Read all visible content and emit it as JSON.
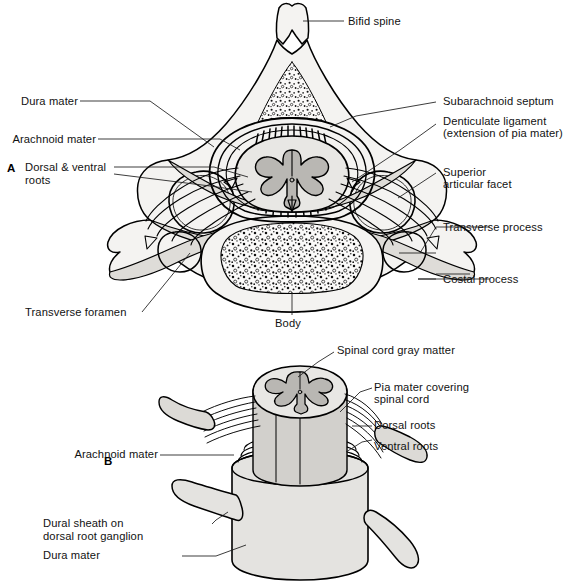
{
  "figure": {
    "type": "anatomical-line-diagram",
    "panel_count": 2,
    "background_color": "#ffffff",
    "ink_color": "#000000"
  },
  "panels": [
    {
      "id": "A",
      "letter": "A",
      "view": "Transverse section through cervical vertebra and spinal cord",
      "labels": [
        {
          "key": "bifid-spine",
          "text": "Bifid spine",
          "side": "right",
          "lines": [
            "Bifid spine"
          ]
        },
        {
          "key": "subarachnoid-septum",
          "text": "Subarachnoid septum",
          "side": "right",
          "lines": [
            "Subarachnoid septum"
          ]
        },
        {
          "key": "denticulate-ligament",
          "text": "Denticulate ligament (extension of pia mater)",
          "side": "right",
          "lines": [
            "Denticulate ligament",
            "(extension of pia mater)"
          ]
        },
        {
          "key": "superior-articular-facet",
          "text": "Superior articular facet",
          "side": "right",
          "lines": [
            "Superior",
            "articular facet"
          ]
        },
        {
          "key": "transverse-process",
          "text": "Transverse process",
          "side": "right",
          "lines": [
            "Transverse process"
          ]
        },
        {
          "key": "costal-process",
          "text": "Costal process",
          "side": "right",
          "lines": [
            "Costal process"
          ]
        },
        {
          "key": "dura-mater",
          "text": "Dura mater",
          "side": "left",
          "lines": [
            "Dura mater"
          ]
        },
        {
          "key": "arachnoid-mater",
          "text": "Arachnoid mater",
          "side": "left",
          "lines": [
            "Arachnoid mater"
          ]
        },
        {
          "key": "dorsal-ventral-roots",
          "text": "Dorsal & ventral roots",
          "side": "left",
          "lines": [
            "Dorsal & ventral",
            "roots"
          ]
        },
        {
          "key": "transverse-foramen",
          "text": "Transverse foramen",
          "side": "left",
          "lines": [
            "Transverse foramen"
          ]
        },
        {
          "key": "body",
          "text": "Body",
          "side": "bottom",
          "lines": [
            "Body"
          ]
        }
      ]
    },
    {
      "id": "B",
      "letter": "B",
      "view": "Three-dimensional view of spinal cord within dural sheath",
      "labels": [
        {
          "key": "spinal-cord-gray-matter",
          "text": "Spinal cord gray matter",
          "side": "right",
          "lines": [
            "Spinal cord gray matter"
          ]
        },
        {
          "key": "pia-mater-covering-spinal-cord",
          "text": "Pia mater covering spinal cord",
          "side": "right",
          "lines": [
            "Pia mater covering",
            "spinal cord"
          ]
        },
        {
          "key": "dorsal-roots",
          "text": "Dorsal roots",
          "side": "right",
          "lines": [
            "Dorsal roots"
          ]
        },
        {
          "key": "ventral-roots",
          "text": "Ventral roots",
          "side": "right",
          "lines": [
            "Ventral roots"
          ]
        },
        {
          "key": "arachnoid-mater",
          "text": "Arachnoid mater",
          "side": "left",
          "lines": [
            "Arachnoid mater"
          ]
        },
        {
          "key": "dural-sheath-on-dorsal-root-ganglion",
          "text": "Dural sheath on dorsal root ganglion",
          "side": "left",
          "lines": [
            "Dural sheath on",
            "dorsal root ganglion"
          ]
        },
        {
          "key": "dura-mater",
          "text": "Dura mater",
          "side": "left",
          "lines": [
            "Dura mater"
          ]
        }
      ]
    }
  ],
  "label_text": {
    "a_bifid_spine": "Bifid spine",
    "a_subarachnoid_septum": "Subarachnoid septum",
    "a_denticulate_l1": "Denticulate ligament",
    "a_denticulate_l2": "(extension of pia mater)",
    "a_superior_l1": "Superior",
    "a_superior_l2": "articular facet",
    "a_transverse_process": "Transverse process",
    "a_costal_process": "Costal process",
    "a_dura_mater": "Dura mater",
    "a_arachnoid_mater": "Arachnoid mater",
    "a_roots_l1": "Dorsal & ventral",
    "a_roots_l2": "roots",
    "a_transverse_foramen": "Transverse foramen",
    "a_body": "Body",
    "b_gray_matter": "Spinal cord gray matter",
    "b_pia_l1": "Pia mater covering",
    "b_pia_l2": "spinal cord",
    "b_dorsal_roots": "Dorsal roots",
    "b_ventral_roots": "Ventral roots",
    "b_arachnoid_mater": "Arachnoid mater",
    "b_dural_sheath_l1": "Dural sheath on",
    "b_dural_sheath_l2": "dorsal root ganglion",
    "b_dura_mater": "Dura mater",
    "panel_a_letter": "A",
    "panel_b_letter": "B"
  },
  "colors": {
    "ink": "#000000",
    "bone_fill": "#f4f3f1",
    "bone_shade": "#dedcd8",
    "gray_matter": "#b9b7b3",
    "white_matter": "#e8e7e4",
    "dura_fill": "#e4e3e0",
    "cord_body": "#d2d0cc"
  }
}
